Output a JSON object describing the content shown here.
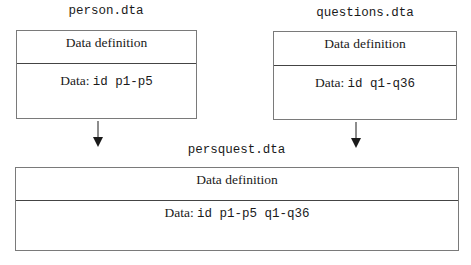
{
  "diagram": {
    "sources": [
      {
        "filename": "person.dta",
        "definition_label": "Data definition",
        "data_prefix": "Data:",
        "data_vars": "id p1-p5"
      },
      {
        "filename": "questions.dta",
        "definition_label": "Data definition",
        "data_prefix": "Data:",
        "data_vars": "id q1-q36"
      }
    ],
    "result": {
      "filename": "persquest.dta",
      "definition_label": "Data definition",
      "data_prefix": "Data:",
      "data_vars": "id p1-p5 q1-q36"
    },
    "edges": [
      {
        "from": "person.dta",
        "to": "persquest.dta"
      },
      {
        "from": "questions.dta",
        "to": "persquest.dta"
      }
    ]
  }
}
